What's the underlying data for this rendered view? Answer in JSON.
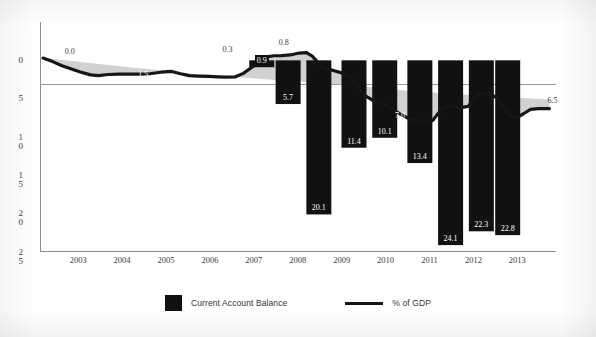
{
  "chart_data": {
    "type": "bar",
    "title": "",
    "subtitle": "",
    "xlabel": "",
    "ylabel": "",
    "grid": false,
    "legend_position": "bottom",
    "x_categories": [
      "2003",
      "2004",
      "2005",
      "2006",
      "2007",
      "2008",
      "2009",
      "2010",
      "2011",
      "2012",
      "2013"
    ],
    "y_ticks": [
      "0",
      "5",
      "10",
      "15",
      "20",
      "25"
    ],
    "y_ticks_display": [
      [
        "0"
      ],
      [
        "5"
      ],
      [
        "1",
        "0"
      ],
      [
        "1",
        "5"
      ],
      [
        "2",
        "0"
      ],
      [
        "2",
        "5"
      ]
    ],
    "ylim": [
      -25,
      5
    ],
    "series": [
      {
        "name": "Current Account Balance",
        "type": "bar",
        "color": "#111111",
        "points": [
          {
            "x": 2007.6,
            "value": -0.9,
            "label": "0.9"
          },
          {
            "x": 2008.2,
            "value": -5.7,
            "label": "5.7"
          },
          {
            "x": 2008.9,
            "value": -20.1,
            "label": "20.1"
          },
          {
            "x": 2009.7,
            "value": -11.4,
            "label": "11.4"
          },
          {
            "x": 2010.4,
            "value": -10.1,
            "label": "10.1"
          },
          {
            "x": 2011.2,
            "value": -13.4,
            "label": "13.4"
          },
          {
            "x": 2011.9,
            "value": -24.1,
            "label": "24.1"
          },
          {
            "x": 2012.6,
            "value": -22.3,
            "label": "22.3"
          },
          {
            "x": 2013.2,
            "value": -22.8,
            "label": "22.8"
          }
        ]
      },
      {
        "name": "% of GDP",
        "type": "line",
        "color": "#161616",
        "labels": [
          {
            "x": 2003.0,
            "value": 0.0,
            "label": "0.0"
          },
          {
            "x": 2004.9,
            "value": -1.5,
            "label": "1.5"
          },
          {
            "x": 2007.0,
            "value": 0.3,
            "label": "0.3"
          },
          {
            "x": 2008.1,
            "value": 0.8,
            "label": "0.8"
          },
          {
            "x": 2010.7,
            "value": -7.0,
            "label": "7.0"
          },
          {
            "x": 2013.9,
            "value": -6.5,
            "label": "6.5"
          }
        ]
      }
    ],
    "shaded_area_color": "#c9c9c9"
  },
  "legend": {
    "items": [
      {
        "label": "Current Account Balance",
        "marker": "filled-square",
        "color": "#111111"
      },
      {
        "label": "% of GDP",
        "marker": "line",
        "color": "#161616"
      }
    ]
  }
}
